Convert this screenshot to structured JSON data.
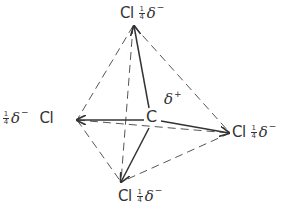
{
  "diagram": {
    "central_atom": {
      "symbol": "C",
      "charge": "δ",
      "charge_sign": "+"
    },
    "ligands": [
      {
        "position": "top",
        "symbol": "Cl",
        "frac_num": "1",
        "frac_den": "4",
        "charge": "δ",
        "charge_sign": "−"
      },
      {
        "position": "left",
        "symbol": "Cl",
        "frac_num": "1",
        "frac_den": "4",
        "charge": "δ",
        "charge_sign": "−"
      },
      {
        "position": "right",
        "symbol": "Cl",
        "frac_num": "1",
        "frac_den": "4",
        "charge": "δ",
        "charge_sign": "−"
      },
      {
        "position": "bottom",
        "symbol": "Cl",
        "frac_num": "1",
        "frac_den": "4",
        "charge": "δ",
        "charge_sign": "−"
      }
    ],
    "colors": {
      "line": "#333333",
      "dashed": "#555555",
      "background": "#ffffff"
    }
  }
}
